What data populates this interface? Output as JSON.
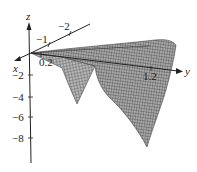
{
  "figure": {
    "type": "3d-surface-plot",
    "axes": {
      "x": {
        "label": "x",
        "ticks": [
          "-1",
          "-2",
          "0.2"
        ]
      },
      "y": {
        "label": "y",
        "ticks": [
          "1.2"
        ]
      },
      "z": {
        "label": "z",
        "ticks": [
          "-2",
          "-4",
          "-6",
          "-8"
        ]
      }
    },
    "surface": {
      "description": "Mesh surface with two downward lobes",
      "color": "#8a8a8a",
      "mesh_color": "#555555"
    }
  },
  "labels": {
    "z_axis": "z",
    "y_axis": "y",
    "x_axis": "x",
    "x_tick_neg1": "−1",
    "x_tick_neg2": "−2",
    "x_tick_02": "0.2",
    "y_tick_12": "1.2",
    "z_tick_neg2": "−2",
    "z_tick_neg4": "−4",
    "z_tick_neg6": "−6",
    "z_tick_neg8": "−8"
  }
}
